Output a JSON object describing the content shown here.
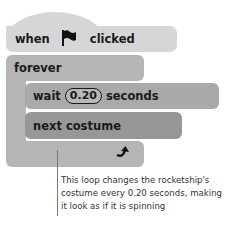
{
  "hat_block": {
    "word_when": "when",
    "icon": "flag-icon",
    "word_clicked": "clicked",
    "color": "#d6d6d6"
  },
  "forever_block": {
    "label": "forever",
    "loop_icon": "loop-arrow-icon",
    "color": "#b5b5b5"
  },
  "wait_block": {
    "word_wait": "wait",
    "value": "0.20",
    "word_seconds": "seconds",
    "color": "#a9a9a9"
  },
  "next_costume_block": {
    "label": "next costume",
    "color": "#979797"
  },
  "annotation": {
    "text": "This loop changes the rocketship's costume every 0.20 seconds, making it look as if it is spinning"
  }
}
